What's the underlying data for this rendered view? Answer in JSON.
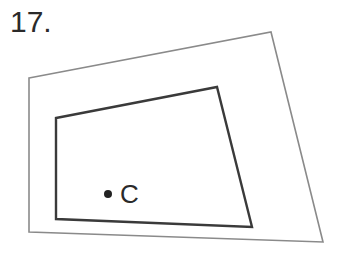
{
  "problem": {
    "number": "17."
  },
  "diagram": {
    "outer_polygon": {
      "points": [
        [
          29,
          78
        ],
        [
          271,
          32
        ],
        [
          323,
          242
        ],
        [
          29,
          232
        ]
      ],
      "stroke": "#8a8a8a",
      "stroke_width": 1.6
    },
    "inner_polygon": {
      "points": [
        [
          56,
          118
        ],
        [
          217,
          87
        ],
        [
          252,
          227
        ],
        [
          56,
          219
        ]
      ],
      "stroke": "#3a3a3a",
      "stroke_width": 2.4
    },
    "point": {
      "label": "C",
      "cx": 108,
      "cy": 194,
      "r": 4,
      "color": "#222222"
    }
  }
}
